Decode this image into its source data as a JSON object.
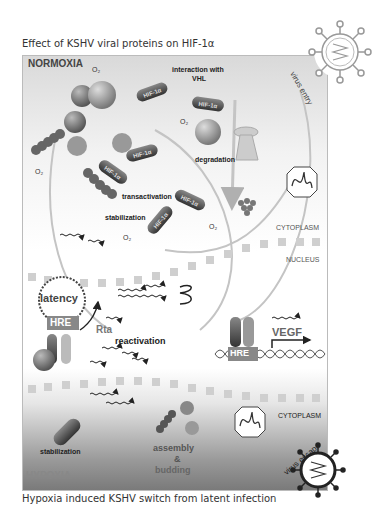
{
  "header": {
    "title": "Effect of KSHV viral proteins on HIF-1α"
  },
  "footer": {
    "caption": "Hypoxia induced KSHV switch from latent infection"
  },
  "regions": {
    "normoxia": "NORMOXIA",
    "hypoxia": "HYPOXIA",
    "cytoplasm_top": "CYTOPLASM",
    "nucleus": "NUCLEUS",
    "cytoplasm_bottom": "CYTOPLASM"
  },
  "labels": {
    "o2": "O₂",
    "interaction": "interaction with",
    "vhl_label": "VHL",
    "degradation": "degradation",
    "transactivation": "transactivation",
    "stabilization_top": "stabilization",
    "stabilization_bottom": "stabilization",
    "virus_entry": "virus entry",
    "virus_escape": "virus escape",
    "latency": "latency",
    "hre": "HRE",
    "rta": "Rta",
    "reactivation": "reactivation",
    "vegf": "VEGF",
    "assembly": "assembly",
    "amp": "&",
    "budding": "budding"
  },
  "proteins": {
    "lana": "LANA",
    "vhl": "VHL",
    "gpcr": "GPCR",
    "vfr3": "vFR3",
    "hif1a": "HIF-1α",
    "hif1b": "HIF-1β"
  },
  "colors": {
    "panel_border": "#bbbbbb",
    "dark_protein": "#555555",
    "mid_protein": "#888888",
    "membrane": "#c8c8c8",
    "arrow": "#b0b0b0"
  }
}
